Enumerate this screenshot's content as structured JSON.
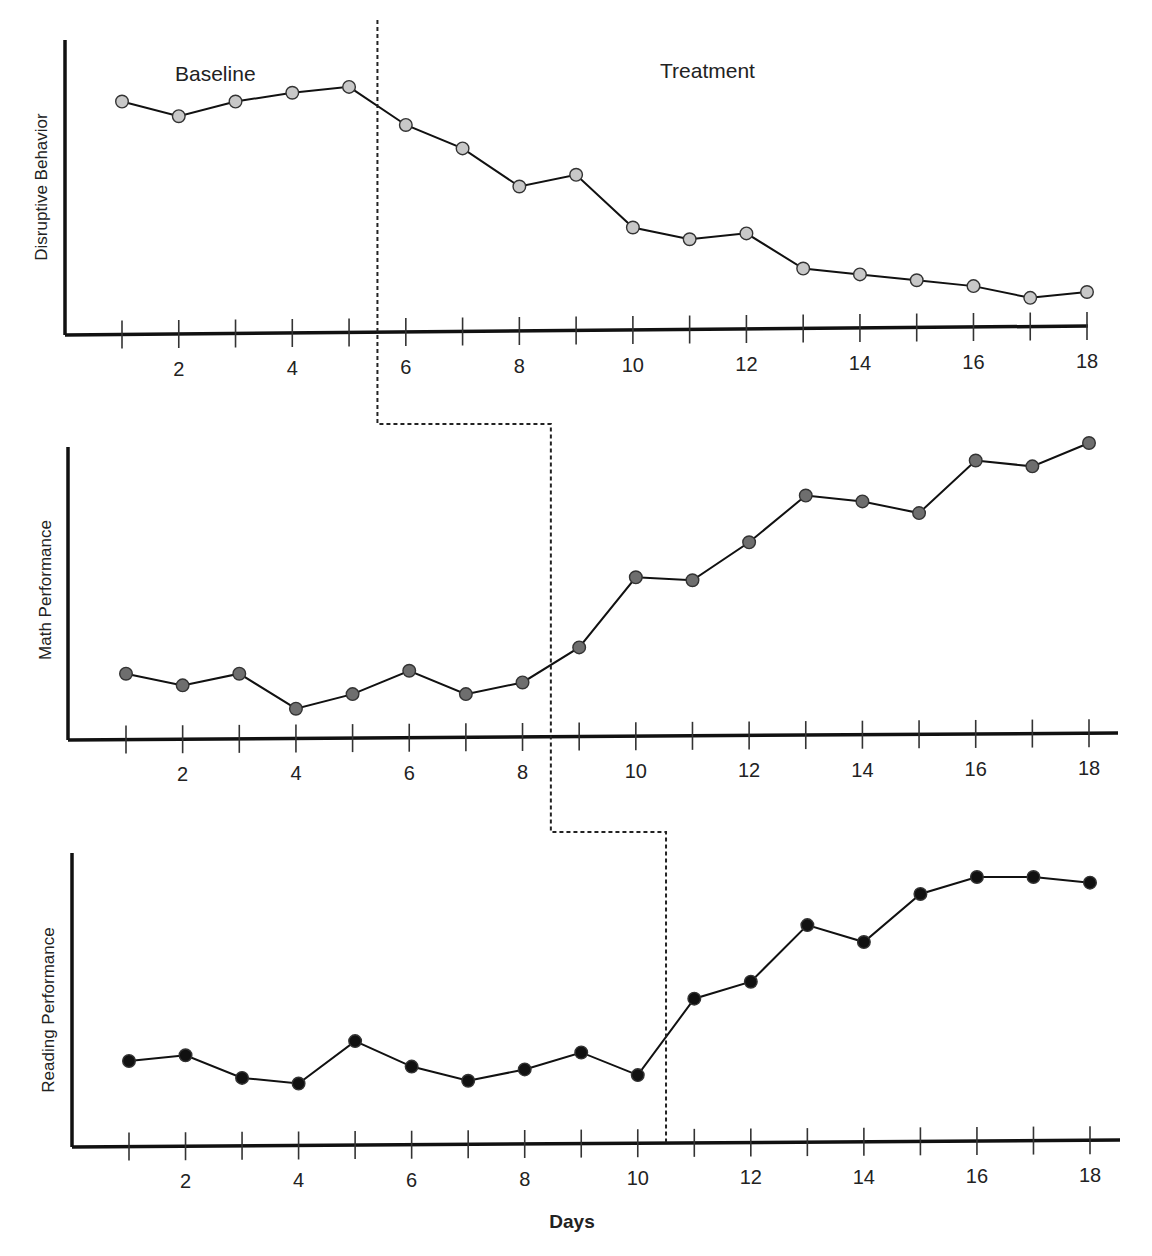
{
  "chart_data": {
    "type": "line",
    "title": "",
    "xlabel": "Days",
    "x": [
      1,
      2,
      3,
      4,
      5,
      6,
      7,
      8,
      9,
      10,
      11,
      12,
      13,
      14,
      15,
      16,
      17,
      18
    ],
    "x_tick_labels": [
      "2",
      "4",
      "6",
      "8",
      "10",
      "12",
      "14",
      "16",
      "18"
    ],
    "phase_labels": [
      "Baseline",
      "Treatment"
    ],
    "design": "multiple-baseline across behaviors",
    "panels": [
      {
        "ylabel": "Disruptive Behavior",
        "marker_color": "#c8c8c8",
        "phase_change_after_day": 5,
        "ylim": [
          0,
          100
        ],
        "values": [
          79,
          74,
          79,
          82,
          84,
          71,
          63,
          50,
          54,
          36,
          32,
          34,
          22,
          20,
          18,
          16,
          12,
          14
        ]
      },
      {
        "ylabel": "Math Performance",
        "marker_color": "#6e6e6e",
        "phase_change_after_day": 8,
        "ylim": [
          0,
          100
        ],
        "values": [
          21,
          17,
          21,
          9,
          14,
          22,
          14,
          18,
          30,
          54,
          53,
          66,
          82,
          80,
          76,
          94,
          92,
          100
        ]
      },
      {
        "ylabel": "Reading Performance",
        "marker_color": "#111111",
        "phase_change_after_day": 10,
        "ylim": [
          0,
          100
        ],
        "values": [
          29,
          31,
          23,
          21,
          36,
          27,
          22,
          26,
          32,
          24,
          51,
          57,
          77,
          71,
          88,
          94,
          94,
          92
        ]
      }
    ]
  },
  "labels": {
    "baseline": "Baseline",
    "treatment": "Treatment",
    "xlabel": "Days",
    "y1": "Disruptive Behavior",
    "y2": "Math Performance",
    "y3": "Reading Performance"
  }
}
